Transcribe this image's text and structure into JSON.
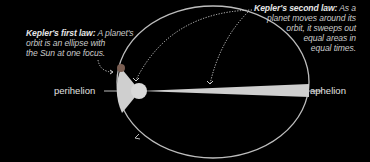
{
  "diagram": {
    "first_law": {
      "heading": "Kepler's first law:",
      "text": "A planet's orbit is an ellipse with the Sun at one focus.",
      "line1_rest": "A planet's",
      "line2": "orbit is an ellipse with",
      "line3": "the Sun at one focus."
    },
    "second_law": {
      "heading": "Kepler's second law:",
      "line1_rest": "As a",
      "line2": "planet moves around its",
      "line3": "orbit, it sweeps out",
      "line4": "equal areas in",
      "line5": "equal times.",
      "text": "As a planet moves around its orbit, it sweeps out equal areas in equal times."
    },
    "labels": {
      "perihelion": "perihelion",
      "aphelion": "aphelion"
    },
    "elements": [
      "orbit-ellipse",
      "sun",
      "planet",
      "equal-area-wedge-perihelion",
      "equal-area-wedge-aphelion",
      "dotted-leader-arrows"
    ],
    "colors": {
      "background": "#000000",
      "orbit": "#bfbfbf",
      "sun": "#d9d9d9",
      "wedge": "#cfcfcf",
      "planet": "#8a6a5a",
      "text": "#c9c9c9"
    }
  }
}
